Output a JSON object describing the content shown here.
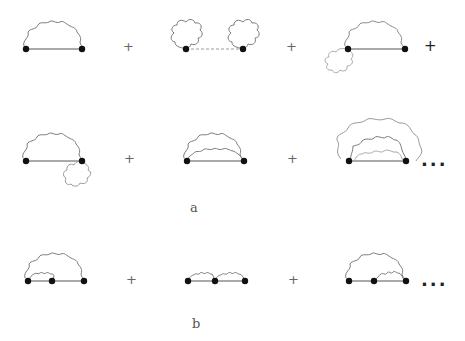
{
  "figure": {
    "panels": [
      {
        "id": "a",
        "label": "a",
        "rows": [
          {
            "diagrams": [
              {
                "description": "self-energy: single photon arc over propagator between two vertices"
              },
              {
                "description": "two tadpole photon loops at each vertex joined by dashed propagator"
              },
              {
                "description": "photon arc with a tadpole loop below left vertex"
              }
            ],
            "operators": [
              "+",
              "+",
              "+"
            ]
          },
          {
            "diagrams": [
              {
                "description": "photon arc with a tadpole loop below right vertex"
              },
              {
                "description": "two nested photon arcs over propagator"
              },
              {
                "description": "three nested photon arcs over propagator"
              }
            ],
            "operators": [
              "+",
              "+"
            ],
            "continuation": "..."
          }
        ]
      },
      {
        "id": "b",
        "label": "b",
        "rows": [
          {
            "diagrams": [
              {
                "description": "large photon arc enclosing a small photon arc, three vertices"
              },
              {
                "description": "two adjacent small photon arcs, three vertices"
              },
              {
                "description": "large photon arc enclosing small photon arc on right, three vertices"
              }
            ],
            "operators": [
              "+",
              "+"
            ],
            "continuation": "..."
          }
        ]
      }
    ]
  },
  "colors": {
    "line": "#777777",
    "vertex": "#111111",
    "dashed": "#999999"
  }
}
